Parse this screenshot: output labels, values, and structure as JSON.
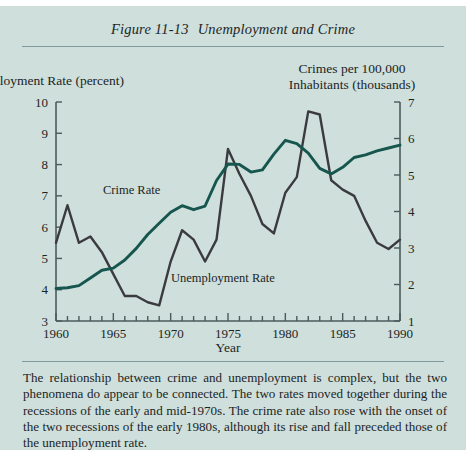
{
  "figure": {
    "number": "Figure 11-13",
    "title": "Unemployment and Crime"
  },
  "caption": "The relationship between crime and unemployment is complex, but the two phenomena do appear to be connected. The two rates moved together during the recessions of the early and mid-1970s. The crime rate also rose with the onset of the two recessions of the early 1980s, although its rise and fall preceded those of the unemployment rate.",
  "colors": {
    "background": "#cfdfdb",
    "crime_line": "#16564f",
    "unemployment_line": "#3b3b3f",
    "axis": "#4b5a5c",
    "rule": "#7e9a9a"
  },
  "chart_data": {
    "type": "line",
    "title": "Unemployment and Crime",
    "xlabel": "Year",
    "x": [
      1960,
      1961,
      1962,
      1963,
      1964,
      1965,
      1966,
      1967,
      1968,
      1969,
      1970,
      1971,
      1972,
      1973,
      1974,
      1975,
      1976,
      1977,
      1978,
      1979,
      1980,
      1981,
      1982,
      1983,
      1984,
      1985,
      1986,
      1987,
      1988,
      1989,
      1990
    ],
    "xlim": [
      1960,
      1990
    ],
    "xticks": [
      1960,
      1961,
      1962,
      1963,
      1964,
      1965,
      1966,
      1967,
      1968,
      1969,
      1970,
      1971,
      1972,
      1973,
      1974,
      1975,
      1976,
      1977,
      1978,
      1979,
      1980,
      1981,
      1982,
      1983,
      1984,
      1985,
      1986,
      1987,
      1988,
      1989,
      1990
    ],
    "xticklabels": [
      "1960",
      "1965",
      "1970",
      "1975",
      "1980",
      "1985",
      "1990"
    ],
    "xticklabel_values": [
      1960,
      1965,
      1970,
      1975,
      1980,
      1985,
      1990
    ],
    "grid": false,
    "legend": "inline-labels",
    "left_axis": {
      "label": "Unemployment Rate (percent)",
      "ylim": [
        3,
        10
      ],
      "yticks": [
        3,
        4,
        5,
        6,
        7,
        8,
        9,
        10
      ],
      "yticklabels": [
        "3",
        "4",
        "5",
        "6",
        "7",
        "8",
        "9",
        "10"
      ]
    },
    "right_axis": {
      "label": "Crimes per 100,000 Inhabitants (thousands)",
      "label_line1": "Crimes per 100,000",
      "label_line2": "Inhabitants (thousands)",
      "ylim": [
        1,
        7
      ],
      "yticks": [
        1,
        2,
        3,
        4,
        5,
        6,
        7
      ],
      "yticklabels": [
        "1",
        "2",
        "3",
        "4",
        "5",
        "6",
        "7"
      ]
    },
    "series": [
      {
        "name": "Unemployment Rate",
        "axis": "left",
        "units": "percent",
        "color": "#3b3b3f",
        "inline_label": "Unemployment Rate",
        "values": [
          5.5,
          6.7,
          5.5,
          5.7,
          5.2,
          4.5,
          3.8,
          3.8,
          3.6,
          3.5,
          4.9,
          5.9,
          5.6,
          4.9,
          5.6,
          8.5,
          7.7,
          7.0,
          6.1,
          5.8,
          7.1,
          7.6,
          9.7,
          9.6,
          7.5,
          7.2,
          7.0,
          6.2,
          5.5,
          5.3,
          5.6
        ]
      },
      {
        "name": "Crime Rate",
        "axis": "right",
        "units": "crimes per 100,000 inhabitants (thousands)",
        "color": "#16564f",
        "inline_label": "Crime Rate",
        "values": [
          1.89,
          1.91,
          1.97,
          2.18,
          2.39,
          2.45,
          2.67,
          2.99,
          3.37,
          3.68,
          3.98,
          4.16,
          4.05,
          4.15,
          4.85,
          5.3,
          5.29,
          5.08,
          5.14,
          5.57,
          5.95,
          5.86,
          5.6,
          5.18,
          5.03,
          5.21,
          5.48,
          5.55,
          5.66,
          5.74,
          5.82
        ]
      }
    ]
  }
}
